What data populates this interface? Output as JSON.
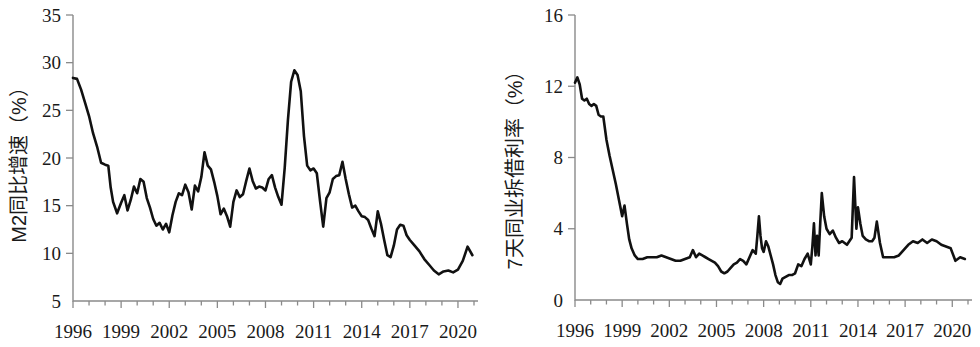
{
  "figure": {
    "panels": [
      "left",
      "right"
    ]
  },
  "chart_data": [
    {
      "id": "m2-growth",
      "type": "line",
      "title": "",
      "xlabel": "",
      "ylabel": "M2同比增速（%）",
      "xlim": [
        1996,
        2021
      ],
      "ylim": [
        5,
        35
      ],
      "ytick_labels": [
        "5",
        "10",
        "15",
        "20",
        "25",
        "30",
        "35"
      ],
      "ytick_values": [
        5,
        10,
        15,
        20,
        25,
        30,
        35
      ],
      "xtick_labels": [
        "1996",
        "1999",
        "2002",
        "2005",
        "2008",
        "2011",
        "2014",
        "2017",
        "2020"
      ],
      "xtick_values": [
        1996,
        1999,
        2002,
        2005,
        2008,
        2011,
        2014,
        2017,
        2020
      ],
      "minor_xticks_per_major": 3,
      "grid": false,
      "legend": "none",
      "line_color": "#111111",
      "series": [
        {
          "name": "M2同比增速",
          "x": [
            1996.0,
            1996.25,
            1996.5,
            1996.75,
            1997.0,
            1997.25,
            1997.5,
            1997.75,
            1998.0,
            1998.2,
            1998.35,
            1998.5,
            1998.75,
            1999.0,
            1999.2,
            1999.4,
            1999.6,
            1999.8,
            2000.0,
            2000.2,
            2000.4,
            2000.6,
            2000.8,
            2001.0,
            2001.2,
            2001.4,
            2001.6,
            2001.8,
            2002.0,
            2002.2,
            2002.4,
            2002.6,
            2002.8,
            2003.0,
            2003.2,
            2003.4,
            2003.6,
            2003.8,
            2004.0,
            2004.2,
            2004.4,
            2004.6,
            2004.8,
            2005.0,
            2005.2,
            2005.4,
            2005.6,
            2005.8,
            2006.0,
            2006.2,
            2006.4,
            2006.6,
            2006.8,
            2007.0,
            2007.2,
            2007.4,
            2007.6,
            2007.8,
            2008.0,
            2008.2,
            2008.4,
            2008.6,
            2008.8,
            2009.0,
            2009.2,
            2009.4,
            2009.6,
            2009.8,
            2010.0,
            2010.2,
            2010.4,
            2010.6,
            2010.8,
            2011.0,
            2011.2,
            2011.4,
            2011.6,
            2011.8,
            2012.0,
            2012.2,
            2012.4,
            2012.6,
            2012.8,
            2013.0,
            2013.2,
            2013.4,
            2013.6,
            2013.8,
            2014.0,
            2014.2,
            2014.4,
            2014.6,
            2014.8,
            2015.0,
            2015.2,
            2015.4,
            2015.6,
            2015.8,
            2016.0,
            2016.2,
            2016.4,
            2016.6,
            2016.8,
            2017.0,
            2017.3,
            2017.6,
            2017.9,
            2018.2,
            2018.5,
            2018.8,
            2019.1,
            2019.4,
            2019.7,
            2020.0,
            2020.3,
            2020.6,
            2020.9
          ],
          "values": [
            28.4,
            28.3,
            27.2,
            25.8,
            24.4,
            22.6,
            21.2,
            19.5,
            19.3,
            19.2,
            16.9,
            15.4,
            14.2,
            15.3,
            16.1,
            14.5,
            15.6,
            17.0,
            16.3,
            17.8,
            17.5,
            15.8,
            14.8,
            13.6,
            12.9,
            13.2,
            12.5,
            13.1,
            12.2,
            14.0,
            15.4,
            16.3,
            16.1,
            17.2,
            16.4,
            14.6,
            17.1,
            16.5,
            18.0,
            20.6,
            19.2,
            18.8,
            17.5,
            16.0,
            14.1,
            14.7,
            13.9,
            12.8,
            15.4,
            16.6,
            15.9,
            16.2,
            17.6,
            18.9,
            17.6,
            16.8,
            17.0,
            16.9,
            16.6,
            17.8,
            18.2,
            16.9,
            15.9,
            15.1,
            19.0,
            24.0,
            28.0,
            29.2,
            28.7,
            27.0,
            22.3,
            19.2,
            18.7,
            18.9,
            18.4,
            15.5,
            12.8,
            15.8,
            16.4,
            17.8,
            18.1,
            18.2,
            19.6,
            17.8,
            16.2,
            14.8,
            15.0,
            14.4,
            13.9,
            13.8,
            13.5,
            12.6,
            11.8,
            14.4,
            13.1,
            11.4,
            9.8,
            9.6,
            10.8,
            12.5,
            13.0,
            12.9,
            11.9,
            11.4,
            10.8,
            10.2,
            9.4,
            8.8,
            8.2,
            7.8,
            8.1,
            8.2,
            8.0,
            8.3,
            9.2,
            10.7,
            9.8
          ]
        }
      ]
    },
    {
      "id": "interbank-7d-rate",
      "type": "line",
      "title": "",
      "xlabel": "",
      "ylabel": "7天同业拆借利率（%）",
      "xlim": [
        1996,
        2021
      ],
      "ylim": [
        0,
        16
      ],
      "ytick_labels": [
        "0",
        "4",
        "8",
        "12",
        "16"
      ],
      "ytick_values": [
        0,
        4,
        8,
        12,
        16
      ],
      "xtick_labels": [
        "1996",
        "1999",
        "2002",
        "2005",
        "2008",
        "2011",
        "2014",
        "2017",
        "2020"
      ],
      "xtick_values": [
        1996,
        1999,
        2002,
        2005,
        2008,
        2011,
        2014,
        2017,
        2020
      ],
      "minor_xticks_per_major": 3,
      "grid": false,
      "legend": "none",
      "line_color": "#111111",
      "series": [
        {
          "name": "7天同业拆借利率",
          "x": [
            1996.0,
            1996.15,
            1996.3,
            1996.45,
            1996.6,
            1996.75,
            1996.9,
            1997.05,
            1997.2,
            1997.35,
            1997.5,
            1997.65,
            1997.8,
            1998.0,
            1998.2,
            1998.4,
            1998.6,
            1998.8,
            1999.0,
            1999.15,
            1999.3,
            1999.45,
            1999.6,
            1999.8,
            2000.0,
            2000.3,
            2000.6,
            2000.9,
            2001.2,
            2001.5,
            2001.8,
            2002.1,
            2002.4,
            2002.7,
            2003.0,
            2003.3,
            2003.5,
            2003.7,
            2003.9,
            2004.1,
            2004.3,
            2004.5,
            2004.7,
            2004.9,
            2005.1,
            2005.3,
            2005.5,
            2005.7,
            2005.9,
            2006.1,
            2006.3,
            2006.5,
            2006.7,
            2006.9,
            2007.1,
            2007.3,
            2007.5,
            2007.6,
            2007.7,
            2007.8,
            2007.9,
            2008.0,
            2008.15,
            2008.3,
            2008.45,
            2008.6,
            2008.75,
            2008.9,
            2009.05,
            2009.2,
            2009.4,
            2009.6,
            2009.8,
            2010.0,
            2010.2,
            2010.4,
            2010.6,
            2010.8,
            2011.0,
            2011.1,
            2011.2,
            2011.3,
            2011.4,
            2011.5,
            2011.6,
            2011.7,
            2011.85,
            2012.0,
            2012.2,
            2012.4,
            2012.6,
            2012.8,
            2013.0,
            2013.15,
            2013.3,
            2013.45,
            2013.6,
            2013.75,
            2013.9,
            2014.0,
            2014.15,
            2014.3,
            2014.5,
            2014.7,
            2014.9,
            2015.05,
            2015.2,
            2015.4,
            2015.6,
            2015.8,
            2016.0,
            2016.3,
            2016.6,
            2016.9,
            2017.2,
            2017.5,
            2017.8,
            2018.1,
            2018.4,
            2018.7,
            2019.0,
            2019.3,
            2019.6,
            2019.9,
            2020.2,
            2020.5,
            2020.8
          ],
          "values": [
            12.2,
            12.5,
            12.1,
            11.3,
            11.2,
            11.3,
            11.0,
            10.9,
            11.0,
            10.9,
            10.4,
            10.3,
            10.3,
            9.0,
            8.1,
            7.3,
            6.5,
            5.6,
            4.7,
            5.3,
            4.3,
            3.4,
            2.9,
            2.5,
            2.3,
            2.3,
            2.4,
            2.4,
            2.4,
            2.5,
            2.4,
            2.3,
            2.2,
            2.2,
            2.3,
            2.4,
            2.8,
            2.4,
            2.6,
            2.5,
            2.4,
            2.3,
            2.2,
            2.1,
            1.9,
            1.6,
            1.5,
            1.6,
            1.8,
            2.0,
            2.1,
            2.3,
            2.2,
            2.0,
            2.4,
            2.8,
            2.6,
            3.6,
            4.7,
            3.6,
            2.9,
            2.7,
            3.3,
            3.0,
            2.5,
            2.0,
            1.4,
            1.0,
            0.9,
            1.2,
            1.3,
            1.4,
            1.4,
            1.5,
            2.0,
            1.9,
            2.3,
            2.6,
            2.0,
            3.0,
            4.3,
            2.5,
            3.6,
            2.5,
            4.3,
            6.0,
            4.7,
            4.0,
            3.7,
            3.9,
            3.5,
            3.2,
            3.3,
            3.2,
            3.1,
            3.3,
            3.5,
            6.9,
            4.0,
            5.2,
            4.3,
            3.6,
            3.4,
            3.3,
            3.3,
            3.5,
            4.4,
            3.2,
            2.4,
            2.4,
            2.4,
            2.4,
            2.5,
            2.8,
            3.1,
            3.3,
            3.2,
            3.4,
            3.2,
            3.4,
            3.3,
            3.1,
            3.0,
            2.9,
            2.2,
            2.4,
            2.3
          ]
        }
      ]
    }
  ]
}
